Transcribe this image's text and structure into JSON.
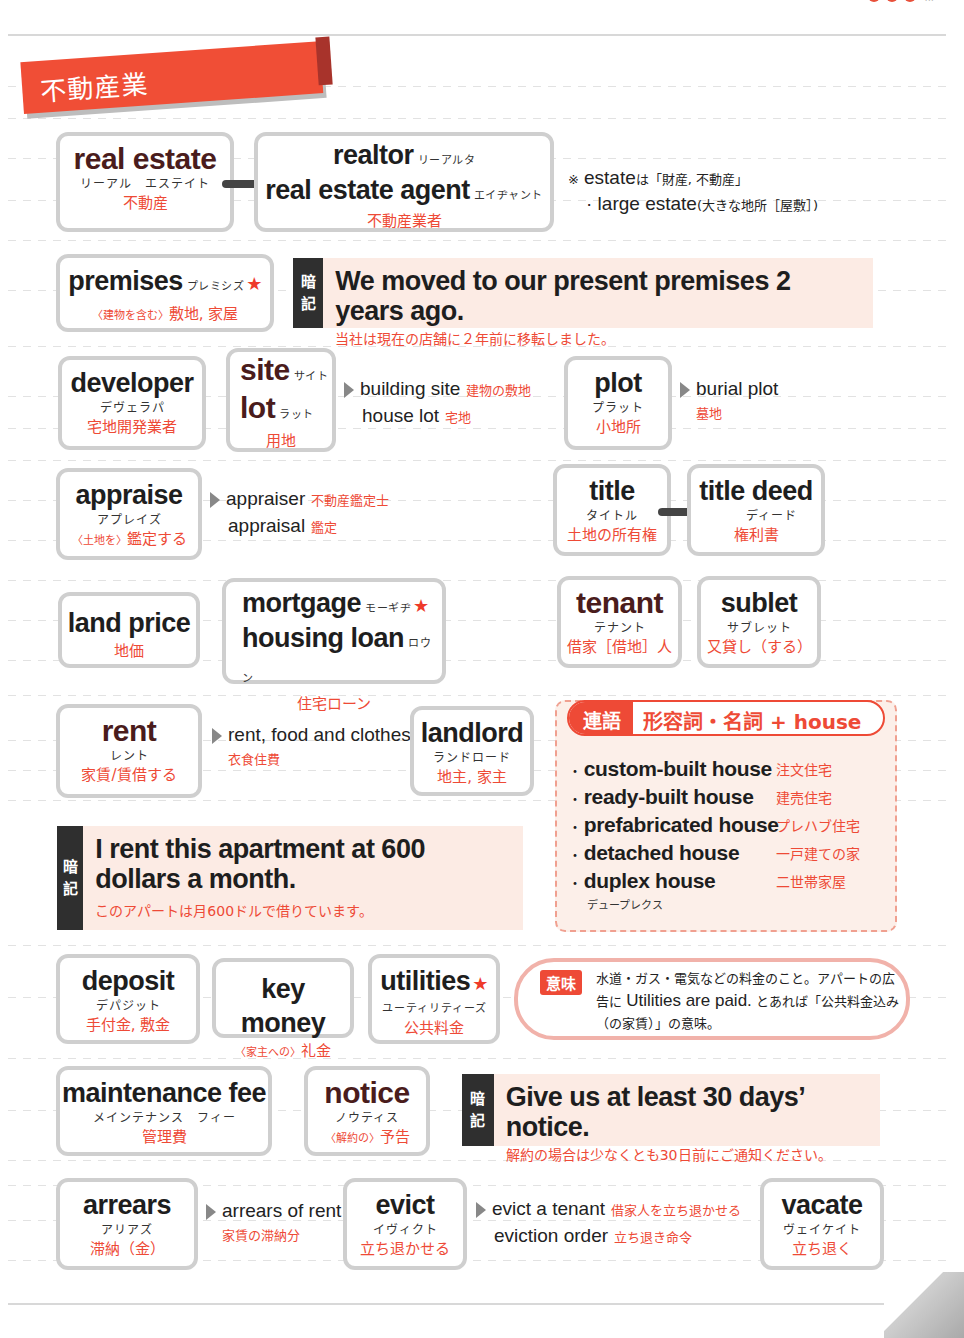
{
  "section": {
    "title": "不動産業"
  },
  "row1": {
    "real_estate": {
      "word": "real estate",
      "kana": "リーアル　エステイト",
      "ja": "不動産"
    },
    "realtor": {
      "word1": "realtor",
      "kana1": "リーアルタ",
      "word2": "real estate agent",
      "kana2": "エイヂャント",
      "ja": "不動産業者"
    },
    "note": {
      "line1_en": "estate",
      "line1_ja": "は「財産, 不動産」",
      "line1_mark": "※",
      "line2_en": "· large estate",
      "line2_ja": "(大きな地所［屋敷］)"
    }
  },
  "row2": {
    "premises": {
      "word": "premises",
      "kana": "プレミシズ",
      "star": "★",
      "qualifier": "〈建物を含む〉",
      "ja": "敷地, 家屋"
    },
    "anki": {
      "tag1": "暗",
      "tag2": "記",
      "en": "We moved to our present premises 2 years ago.",
      "ja": "当社は現在の店舗に２年前に移転しました。"
    }
  },
  "row3": {
    "developer": {
      "word": "developer",
      "kana": "デヴェラパ",
      "ja": "宅地開発業者"
    },
    "site": {
      "word1": "site",
      "kana1": "サイト",
      "word2": "lot",
      "kana2": "ラット",
      "ja": "用地"
    },
    "site_rel": [
      {
        "en": "building site",
        "ja": "建物の敷地"
      },
      {
        "en": "house lot",
        "ja": "宅地"
      }
    ],
    "plot": {
      "word": "plot",
      "kana": "プラット",
      "ja": "小地所"
    },
    "plot_rel": {
      "en": "burial plot",
      "ja": "墓地"
    }
  },
  "row4": {
    "appraise": {
      "word": "appraise",
      "kana": "アプレイズ",
      "qualifier": "〈土地を〉",
      "ja": "鑑定する"
    },
    "appraise_rel": [
      {
        "en": "appraiser",
        "ja": "不動産鑑定士"
      },
      {
        "en": "appraisal",
        "ja": "鑑定"
      }
    ],
    "title": {
      "word": "title",
      "kana": "タイトル",
      "ja": "土地の所有権"
    },
    "title_deed": {
      "word": "title deed",
      "kana": "ディード",
      "ja": "権利書"
    }
  },
  "row5": {
    "land_price": {
      "word": "land price",
      "ja": "地価"
    },
    "mortgage": {
      "word1": "mortgage",
      "kana1": "モーギヂ",
      "star": "★",
      "word2": "housing loan",
      "kana2": "ロウン",
      "ja": "住宅ローン"
    },
    "tenant": {
      "word": "tenant",
      "kana": "テナント",
      "ja": "借家［借地］人"
    },
    "sublet": {
      "word": "sublet",
      "kana": "サブレット",
      "ja": "又貸し（する）"
    }
  },
  "row6": {
    "rent": {
      "word": "rent",
      "kana": "レント",
      "ja": "家賃/賃借する"
    },
    "rent_rel": {
      "en": "rent, food and clothes",
      "ja": "衣食住費"
    },
    "landlord": {
      "word": "landlord",
      "kana": "ランドロード",
      "ja": "地主, 家主"
    },
    "anki": {
      "tag1": "暗",
      "tag2": "記",
      "en": "I rent this apartment at 600 dollars a month.",
      "ja": "このアパートは月600ドルで借りています。"
    }
  },
  "collocation": {
    "label": "連語",
    "title": "形容詞・名詞 + house",
    "items": [
      {
        "en": "custom-built house",
        "ja": "注文住宅"
      },
      {
        "en": "ready-built house",
        "ja": "建売住宅"
      },
      {
        "en": "prefabricated house",
        "ja": "プレハブ住宅"
      },
      {
        "en": "detached house",
        "ja": "一戸建ての家"
      },
      {
        "en": "duplex house",
        "ja": "二世帯家屋"
      }
    ],
    "duplex_kana": "デュープレクス"
  },
  "row7": {
    "deposit": {
      "word": "deposit",
      "kana": "デパジット",
      "ja": "手付金, 敷金"
    },
    "key_money": {
      "word": "key money",
      "qualifier": "〈家主への〉",
      "ja": "礼金"
    },
    "utilities": {
      "word": "utilities",
      "star": "★",
      "kana": "ユーティリティーズ",
      "ja": "公共料金"
    },
    "meaning": {
      "label": "意味",
      "text1": "水道・ガス・電気などの料金のこと。アパートの広告に",
      "text_en": "Utilities are paid.",
      "text2": "とあれば「公共料金込み（の家賃）」の意味。"
    }
  },
  "row8": {
    "maintenance_fee": {
      "word": "maintenance fee",
      "kana": "メインテナンス　フィー",
      "ja": "管理費"
    },
    "notice": {
      "word": "notice",
      "kana": "ノウティス",
      "qualifier": "〈解約の〉",
      "ja": "予告"
    },
    "anki": {
      "tag1": "暗",
      "tag2": "記",
      "en": "Give us at least 30 days’ notice.",
      "ja": "解約の場合は少なくとも30日前にご通知ください。"
    }
  },
  "row9": {
    "arrears": {
      "word": "arrears",
      "kana": "アリアズ",
      "ja": "滞納（金）"
    },
    "arrears_rel": {
      "en": "arrears of rent",
      "ja": "家賃の滞納分"
    },
    "evict": {
      "word": "evict",
      "kana": "イヴィクト",
      "ja": "立ち退かせる"
    },
    "evict_rel": [
      {
        "en": "evict a tenant",
        "ja": "借家人を立ち退かせる"
      },
      {
        "en": "eviction order",
        "ja": "立ち退き命令"
      }
    ],
    "vacate": {
      "word": "vacate",
      "kana": "ヴェイケイト",
      "ja": "立ち退く"
    }
  },
  "colors": {
    "accent": "#ee4a36",
    "anki_bg": "#fcebe4",
    "anki_tag": "#2f2f2f",
    "card_border": "#cfcfcf"
  }
}
